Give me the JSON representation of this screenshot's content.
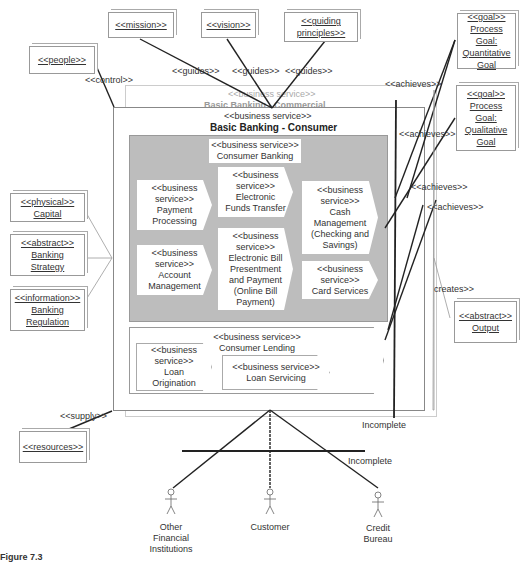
{
  "notes": {
    "people": "<<people>>",
    "mission": "<<mission>>",
    "vision": "<<vision>>",
    "guiding_principles": [
      "<<guiding",
      "principles>>"
    ],
    "goal_quantitative": [
      "<<goal>>",
      "Process",
      "Goal:",
      "Quantitative",
      "Goal"
    ],
    "goal_qualitative": [
      "<<goal>>",
      "Process",
      "Goal:",
      "Qualitative",
      "Goal"
    ],
    "capital": [
      "<<physical>>",
      "Capital"
    ],
    "banking_strategy": [
      "<<abstract>>",
      "Banking",
      "Strategy"
    ],
    "banking_regulation": [
      "<<information>>",
      "Banking",
      "Regulation"
    ],
    "resources": "<<resources>>",
    "output": [
      "<<abstract>>",
      "Output"
    ]
  },
  "labels": {
    "control": "<<control>>",
    "guides_1": "<<guides>>",
    "guides_2": "<<guides>>",
    "guides_3": "<<guides>>",
    "achieves_1": "<<achieves>>",
    "achieves_2": "<<achieves>>",
    "achieves_3": "<<achieves>>",
    "achieves_4": "<<achieves>>",
    "creates": "creates>>",
    "supply": "<<supply>>",
    "incomplete_1": "Incomplete",
    "incomplete_2": "Incomplete"
  },
  "services": {
    "commercial": {
      "stereotype": "<<business service>>",
      "name": "Basic Banking - Commercial"
    },
    "consumer": {
      "stereotype": "<<business service>>",
      "name": "Basic Banking - Consumer"
    },
    "consumer_banking": {
      "stereotype": "<<business service>>",
      "name": "Consumer Banking"
    },
    "payment_processing": [
      "<<business",
      "service>>",
      "Payment",
      "Processing"
    ],
    "eft": [
      "<<business",
      "service>>",
      "Electronic",
      "Funds Transfer"
    ],
    "cash_management": [
      "<<business",
      "service>>",
      "Cash",
      "Management",
      "(Checking and",
      "Savings)"
    ],
    "account_management": [
      "<<business",
      "service>>",
      "Account",
      "Management"
    ],
    "ebpp": [
      "<<business",
      "service>>",
      "Electronic Bill",
      "Presentment",
      "and Payment",
      "(Online Bill",
      "Payment)"
    ],
    "card_services": [
      "<<business",
      "service>>",
      "Card Services"
    ],
    "consumer_lending": {
      "stereotype": "<<business service>>",
      "name": "Consumer Lending"
    },
    "loan_origination": [
      "<<business",
      "service>>",
      "Loan",
      "Origination"
    ],
    "loan_servicing": [
      "<<business service>>",
      "Loan Servicing"
    ]
  },
  "actors": {
    "other_fi": [
      "Other",
      "Financial",
      "Institutions"
    ],
    "customer": [
      "Customer"
    ],
    "credit_bureau": [
      "Credit",
      "Bureau"
    ]
  },
  "caption": "Figure 7.3"
}
